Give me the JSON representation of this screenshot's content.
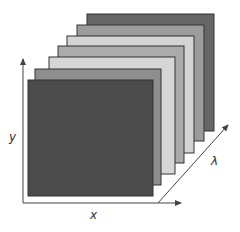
{
  "diagram": {
    "title": "",
    "layers": [
      {
        "name": "band-7",
        "x": 87,
        "y": 14,
        "w": 127,
        "h": 117,
        "fill": "#666666"
      },
      {
        "name": "band-6",
        "x": 77,
        "y": 25,
        "w": 127,
        "h": 116,
        "fill": "#9c9c9c"
      },
      {
        "name": "band-5",
        "x": 67,
        "y": 36,
        "w": 127,
        "h": 117,
        "fill": "#d4d4d4"
      },
      {
        "name": "band-4",
        "x": 58,
        "y": 46,
        "w": 126,
        "h": 117,
        "fill": "#ababab"
      },
      {
        "name": "band-3",
        "x": 49,
        "y": 57,
        "w": 126,
        "h": 117,
        "fill": "#d6d6d6"
      },
      {
        "name": "band-2",
        "x": 35,
        "y": 69,
        "w": 126,
        "h": 116,
        "fill": "#8e8e8e"
      },
      {
        "name": "band-1",
        "x": 28,
        "y": 80,
        "w": 125,
        "h": 116,
        "fill": "#4b4b4b"
      }
    ],
    "axes": {
      "x_label": "x",
      "y_label": "y",
      "lambda_label": "λ"
    },
    "colors": {
      "stroke": "#333333",
      "axis": "#444444"
    }
  }
}
